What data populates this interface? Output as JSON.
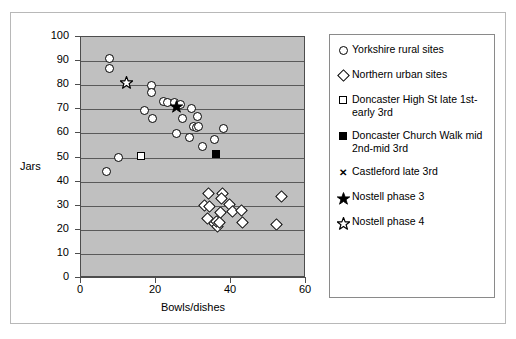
{
  "chart_data": {
    "type": "scatter",
    "title": "",
    "xlabel": "Bowls/dishes",
    "ylabel": "Jars",
    "xlim": [
      0,
      60
    ],
    "ylim": [
      0,
      100
    ],
    "xticks": [
      0,
      20,
      40,
      60
    ],
    "yticks": [
      0,
      10,
      20,
      30,
      40,
      50,
      60,
      70,
      80,
      90,
      100
    ],
    "grid": "horizontal",
    "legend_position": "right",
    "series": [
      {
        "name": "Yorkshire rural sites",
        "marker": "circle-open",
        "points": [
          [
            7.5,
            91.0
          ],
          [
            7.5,
            87.0
          ],
          [
            6.8,
            44.0
          ],
          [
            10.0,
            49.8
          ],
          [
            18.8,
            80.0
          ],
          [
            18.8,
            77.0
          ],
          [
            17.0,
            69.5
          ],
          [
            19.0,
            66.0
          ],
          [
            22.0,
            73.2
          ],
          [
            23.0,
            72.8
          ],
          [
            24.8,
            73.0
          ],
          [
            26.5,
            71.8
          ],
          [
            29.5,
            70.5
          ],
          [
            27.0,
            66.0
          ],
          [
            25.5,
            59.8
          ],
          [
            29.0,
            58.5
          ],
          [
            30.0,
            63.0
          ],
          [
            30.8,
            62.5
          ],
          [
            31.0,
            67.0
          ],
          [
            31.3,
            62.8
          ],
          [
            32.3,
            54.5
          ],
          [
            35.5,
            57.5
          ],
          [
            38.0,
            62.0
          ]
        ]
      },
      {
        "name": "Northern urban sites",
        "marker": "diamond-open",
        "points": [
          [
            34.0,
            35.0
          ],
          [
            33.0,
            30.0
          ],
          [
            34.2,
            29.5
          ],
          [
            33.8,
            24.5
          ],
          [
            35.5,
            22.5
          ],
          [
            36.3,
            21.5
          ],
          [
            36.0,
            23.3
          ],
          [
            36.8,
            23.0
          ],
          [
            37.8,
            35.0
          ],
          [
            37.5,
            33.0
          ],
          [
            37.2,
            27.0
          ],
          [
            39.5,
            30.5
          ],
          [
            40.5,
            27.5
          ],
          [
            42.8,
            28.0
          ],
          [
            43.0,
            23.0
          ],
          [
            53.5,
            34.0
          ],
          [
            52.0,
            22.0
          ]
        ]
      },
      {
        "name": "Doncaster High St late 1st-early 3rd",
        "marker": "square-open",
        "points": [
          [
            16.0,
            50.5
          ]
        ]
      },
      {
        "name": "Doncaster Church Walk mid 2nd-mid 3rd",
        "marker": "square-filled",
        "points": [
          [
            36.0,
            51.5
          ]
        ]
      },
      {
        "name": "Castleford late 3rd",
        "marker": "cross",
        "points": []
      },
      {
        "name": "Nostell phase 3",
        "marker": "star-filled",
        "points": [
          [
            25.5,
            71.5
          ]
        ]
      },
      {
        "name": "Nostell phase 4",
        "marker": "star-open",
        "points": [
          [
            12.0,
            81.5
          ]
        ]
      }
    ]
  },
  "legend": {
    "entries": [
      {
        "label": "Yorkshire rural sites",
        "icon": "circle-open-icon"
      },
      {
        "label": "Northern urban sites",
        "icon": "diamond-open-icon"
      },
      {
        "label": "Doncaster High St late 1st-early 3rd",
        "icon": "square-open-icon"
      },
      {
        "label": "Doncaster Church Walk mid 2nd-mid 3rd",
        "icon": "square-filled-icon"
      },
      {
        "label": "Castleford late 3rd",
        "icon": "cross-icon"
      },
      {
        "label": "Nostell phase 3",
        "icon": "star-filled-icon"
      },
      {
        "label": "Nostell phase 4",
        "icon": "star-open-icon"
      }
    ]
  }
}
